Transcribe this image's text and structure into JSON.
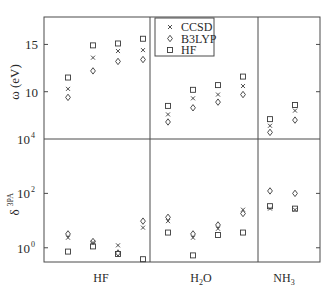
{
  "chart_data": {
    "type": "scatter",
    "title": "",
    "legend": {
      "position": "upper-center (inside top panel)",
      "entries": [
        {
          "label": "CCSD",
          "marker": "x"
        },
        {
          "label": "B3LYP",
          "marker": "diamond"
        },
        {
          "label": "HF",
          "marker": "square"
        }
      ]
    },
    "categories": [
      "HF",
      "H2O",
      "NH3"
    ],
    "category_labels": [
      {
        "base": "HF",
        "sub": "",
        "tail": ""
      },
      {
        "base": "H",
        "sub": "2",
        "tail": "O"
      },
      {
        "base": "NH",
        "sub": "3",
        "tail": ""
      }
    ],
    "states_per_molecule": {
      "HF": 4,
      "H2O": 4,
      "NH3": 2
    },
    "panels": [
      {
        "name": "excitation-energy",
        "ylabel": "ω (eV)",
        "yscale": "linear",
        "ylim": [
          5.0,
          17.9
        ],
        "yticks": [
          10,
          15
        ],
        "ytick_labels": [
          "10",
          "15"
        ],
        "series": [
          {
            "name": "CCSD",
            "values": [
              10.3,
              13.6,
              14.3,
              14.4,
              7.6,
              9.3,
              9.7,
              10.6,
              6.4,
              8.0
            ]
          },
          {
            "name": "B3LYP",
            "values": [
              9.4,
              12.2,
              13.2,
              13.4,
              6.8,
              8.3,
              8.9,
              9.7,
              5.7,
              7.0
            ]
          },
          {
            "name": "HF",
            "values": [
              11.5,
              14.9,
              15.1,
              15.6,
              8.5,
              10.2,
              10.7,
              11.6,
              7.1,
              8.6
            ]
          }
        ]
      },
      {
        "name": "three-photon-strength",
        "ylabel": "δ3PA",
        "ylabel_base": "δ",
        "ylabel_sup": "3PA",
        "yscale": "log",
        "ylim": [
          0.3,
          10000
        ],
        "yticks": [
          1,
          100,
          10000
        ],
        "ytick_labels": [
          {
            "base": "10",
            "exp": "0"
          },
          {
            "base": "10",
            "exp": "2"
          },
          {
            "base": "10",
            "exp": "4"
          }
        ],
        "series": [
          {
            "name": "CCSD",
            "log10_values": [
              0.37,
              0.19,
              0.09,
              0.74,
              0.98,
              0.37,
              0.7,
              1.4,
              1.44,
              1.4
            ]
          },
          {
            "name": "B3LYP",
            "log10_values": [
              0.51,
              0.23,
              -0.19,
              0.98,
              1.12,
              0.51,
              0.84,
              1.26,
              2.09,
              2.0
            ]
          },
          {
            "name": "HF",
            "log10_values": [
              -0.14,
              0.05,
              -0.23,
              -0.42,
              0.56,
              -0.28,
              0.47,
              0.56,
              1.53,
              1.44
            ]
          }
        ]
      }
    ],
    "grid": false,
    "xlabel": ""
  },
  "layout": {
    "frame": {
      "left": 44,
      "top": 17,
      "right": 320,
      "bottom": 262,
      "split": 139
    },
    "dividers_x": [
      150,
      258
    ],
    "point_x": [
      68,
      93,
      118,
      143,
      168,
      193,
      218,
      243,
      270,
      295
    ],
    "category_label_x": [
      101,
      201,
      284
    ],
    "colors": {
      "axis": "#4a4a4a",
      "marker": "#3a3a3a",
      "text": "#2a2a2a",
      "background": "#ffffff"
    }
  }
}
